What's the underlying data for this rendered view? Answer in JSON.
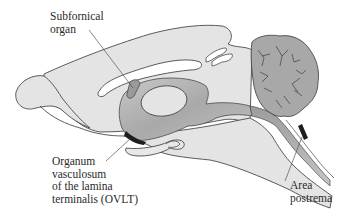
{
  "diagram": {
    "colors": {
      "background": "#ffffff",
      "brain_fill": "#e4e4e4",
      "outline": "#4a4a4a",
      "ventricle_fill": "#b4b4b4",
      "ventricle_shadow": "#8e8e8e",
      "cerebellum_fill": "#a8a8a8",
      "organ_dark": "#1e1e1e",
      "sfo_fill": "#9a9a9a",
      "label_text": "#2a2a2a"
    },
    "labels": {
      "subfornical_organ": {
        "lines": [
          "Subfornical",
          "organ"
        ]
      },
      "ovlt": {
        "lines": [
          "Organum",
          "vasculosum",
          "of the lamina",
          "terminalis (OVLT)"
        ]
      },
      "area_postrema": {
        "lines": [
          "Area",
          "postrema"
        ]
      }
    },
    "structures": [
      {
        "name": "cerebral-hemisphere",
        "shade": "light"
      },
      {
        "name": "olfactory-bulb",
        "shade": "light"
      },
      {
        "name": "corpus-callosum",
        "shade": "white"
      },
      {
        "name": "third-ventricle",
        "shade": "medium"
      },
      {
        "name": "thalamus-massa-intermedia",
        "shade": "light"
      },
      {
        "name": "cerebral-aqueduct",
        "shade": "medium"
      },
      {
        "name": "fourth-ventricle",
        "shade": "medium"
      },
      {
        "name": "cerebellum",
        "shade": "dark"
      },
      {
        "name": "brainstem",
        "shade": "light"
      },
      {
        "name": "spinal-cord-central-canal",
        "shade": "light"
      },
      {
        "name": "subfornical-organ",
        "shade": "medium-dark"
      },
      {
        "name": "ovlt",
        "shade": "black"
      },
      {
        "name": "area-postrema",
        "shade": "black"
      },
      {
        "name": "pituitary-hypothalamus",
        "shade": "light"
      }
    ]
  }
}
